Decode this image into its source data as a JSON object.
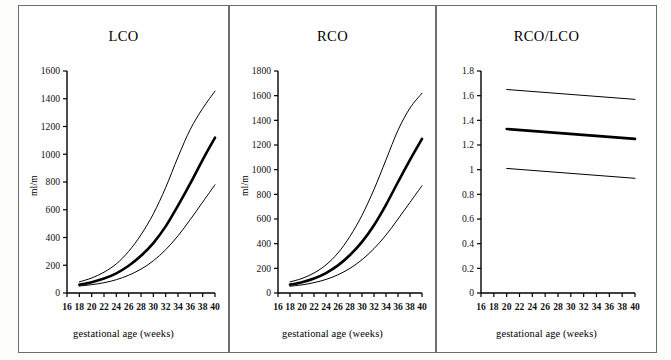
{
  "figure": {
    "background": "#ffffff",
    "border_color": "#6e6e6e",
    "line_color": "#000000"
  },
  "panels": [
    {
      "id": "lco",
      "title": "LCO",
      "ylabel": "ml/m",
      "xlabel": "gestational age (weeks)"
    },
    {
      "id": "rco",
      "title": "RCO",
      "ylabel": "ml/m",
      "xlabel": "gestational age (weeks)"
    },
    {
      "id": "rco-lco",
      "title": "RCO/LCO",
      "ylabel": "",
      "xlabel": "gestational age (weeks)"
    }
  ],
  "chart_data": [
    {
      "type": "line",
      "title": "LCO",
      "xlabel": "gestational age (weeks)",
      "ylabel": "ml/m",
      "xlim": [
        16,
        40
      ],
      "ylim": [
        0,
        1600
      ],
      "xticks": [
        16,
        18,
        20,
        22,
        24,
        26,
        28,
        30,
        32,
        34,
        36,
        38,
        40
      ],
      "yticks": [
        0,
        200,
        400,
        600,
        800,
        1000,
        1200,
        1400,
        1600
      ],
      "xtick_labels": [
        "16",
        "18",
        "20",
        "22",
        "24",
        "26",
        "28",
        "30",
        "32",
        "34",
        "36",
        "38",
        "40"
      ],
      "ytick_labels": [
        "0",
        "200",
        "400",
        "600",
        "800",
        "1000",
        "1200",
        "1400",
        "1600"
      ],
      "grid": false,
      "legend": "none",
      "x": [
        18,
        20,
        22,
        24,
        26,
        28,
        30,
        32,
        34,
        36,
        38,
        40
      ],
      "series": [
        {
          "name": "upper 95% limit",
          "style": "thin",
          "values": [
            80,
            108,
            150,
            210,
            300,
            420,
            570,
            760,
            980,
            1180,
            1330,
            1455
          ]
        },
        {
          "name": "mean",
          "style": "thick",
          "values": [
            60,
            78,
            104,
            142,
            196,
            268,
            360,
            480,
            630,
            790,
            960,
            1120
          ]
        },
        {
          "name": "lower 95% limit",
          "style": "thin",
          "values": [
            50,
            60,
            74,
            96,
            128,
            172,
            232,
            312,
            412,
            530,
            655,
            780
          ]
        }
      ]
    },
    {
      "type": "line",
      "title": "RCO",
      "xlabel": "gestational age (weeks)",
      "ylabel": "ml/m",
      "xlim": [
        16,
        40
      ],
      "ylim": [
        0,
        1800
      ],
      "xticks": [
        16,
        18,
        20,
        22,
        24,
        26,
        28,
        30,
        32,
        34,
        36,
        38,
        40
      ],
      "yticks": [
        0,
        200,
        400,
        600,
        800,
        1000,
        1200,
        1400,
        1600,
        1800
      ],
      "xtick_labels": [
        "16",
        "18",
        "20",
        "22",
        "24",
        "26",
        "28",
        "30",
        "32",
        "34",
        "36",
        "38",
        "40"
      ],
      "ytick_labels": [
        "0",
        "200",
        "400",
        "600",
        "800",
        "1000",
        "1200",
        "1400",
        "1600",
        "1800"
      ],
      "grid": false,
      "legend": "none",
      "x": [
        18,
        20,
        22,
        24,
        26,
        28,
        30,
        32,
        34,
        36,
        38,
        40
      ],
      "series": [
        {
          "name": "upper 95% limit",
          "style": "thin",
          "values": [
            90,
            118,
            162,
            228,
            325,
            460,
            630,
            840,
            1080,
            1320,
            1500,
            1620
          ]
        },
        {
          "name": "mean",
          "style": "thick",
          "values": [
            68,
            88,
            118,
            162,
            224,
            308,
            415,
            550,
            715,
            900,
            1080,
            1250
          ]
        },
        {
          "name": "lower 95% limit",
          "style": "thin",
          "values": [
            55,
            66,
            84,
            110,
            148,
            200,
            270,
            360,
            470,
            600,
            735,
            870
          ]
        }
      ]
    },
    {
      "type": "line",
      "title": "RCO/LCO",
      "xlabel": "gestational age (weeks)",
      "ylabel": "",
      "xlim": [
        16,
        40
      ],
      "ylim": [
        0,
        1.8
      ],
      "xticks": [
        16,
        18,
        20,
        22,
        24,
        26,
        28,
        30,
        32,
        34,
        36,
        38,
        40
      ],
      "yticks": [
        0,
        0.2,
        0.4,
        0.6,
        0.8,
        1,
        1.2,
        1.4,
        1.6,
        1.8
      ],
      "xtick_labels": [
        "16",
        "18",
        "20",
        "22",
        "24",
        "26",
        "28",
        "30",
        "32",
        "34",
        "36",
        "38",
        "40"
      ],
      "ytick_labels": [
        "0",
        "0.2",
        "0.4",
        "0.6",
        "0.8",
        "1",
        "1.2",
        "1.4",
        "1.6",
        "1.8"
      ],
      "grid": false,
      "legend": "none",
      "x": [
        20,
        40
      ],
      "series": [
        {
          "name": "upper 95% limit",
          "style": "thin",
          "values": [
            1.65,
            1.57
          ]
        },
        {
          "name": "mean",
          "style": "thick",
          "values": [
            1.33,
            1.25
          ]
        },
        {
          "name": "lower 95% limit",
          "style": "thin",
          "values": [
            1.01,
            0.93
          ]
        }
      ]
    }
  ]
}
